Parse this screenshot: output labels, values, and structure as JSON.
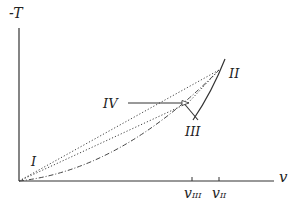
{
  "diagram": {
    "axes": {
      "y_label": "-T",
      "x_label": "v",
      "x_ticks": [
        {
          "label": "v",
          "sub": "III",
          "x": 192
        },
        {
          "label": "v",
          "sub": "II",
          "x": 219
        }
      ]
    },
    "points": [
      {
        "id": "I",
        "label": "I"
      },
      {
        "id": "II",
        "label": "II"
      },
      {
        "id": "III",
        "label": "III"
      },
      {
        "id": "IV",
        "label": "IV"
      }
    ],
    "colors": {
      "line": "#333333",
      "background": "#ffffff"
    }
  }
}
